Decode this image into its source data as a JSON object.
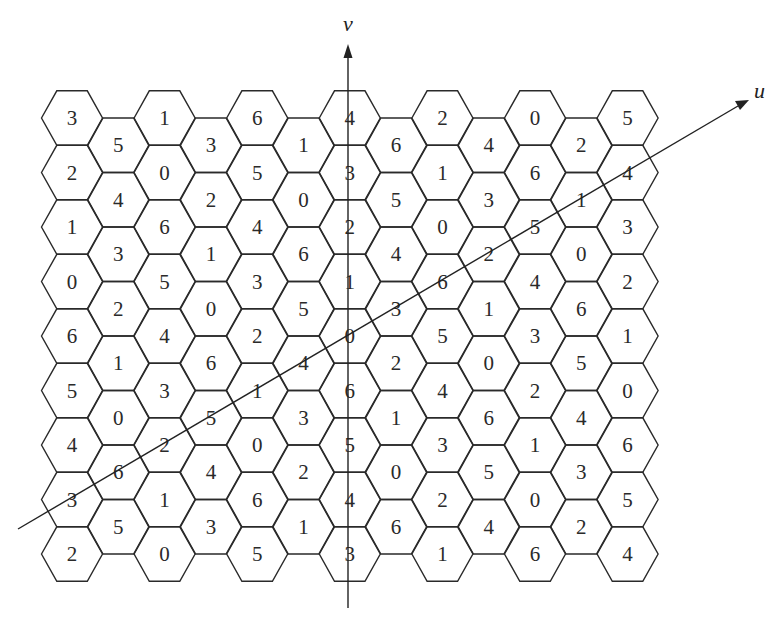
{
  "figure": {
    "type": "hexagonal-grid-diagram",
    "axes": {
      "u_label": "u",
      "v_label": "v"
    },
    "grid": {
      "columns": 11,
      "rows": 10,
      "layout": "flat-top hexagons; odd columns offset down by half a cell",
      "values_by_column": [
        [
          3,
          2,
          1,
          0,
          6,
          5,
          4,
          3,
          2
        ],
        [
          5,
          4,
          3,
          2,
          1,
          0,
          6,
          5
        ],
        [
          1,
          0,
          6,
          5,
          4,
          3,
          2,
          1,
          0
        ],
        [
          3,
          2,
          1,
          0,
          6,
          5,
          4,
          3
        ],
        [
          6,
          5,
          4,
          3,
          2,
          1,
          0,
          6,
          5
        ],
        [
          1,
          0,
          6,
          5,
          4,
          3,
          2,
          1
        ],
        [
          4,
          3,
          2,
          1,
          0,
          6,
          5,
          4,
          3
        ],
        [
          6,
          5,
          4,
          3,
          2,
          1,
          0,
          6
        ],
        [
          2,
          1,
          0,
          6,
          5,
          4,
          3,
          2,
          1
        ],
        [
          4,
          3,
          2,
          1,
          0,
          6,
          5,
          4
        ],
        [
          0,
          6,
          5,
          4,
          3,
          2,
          1,
          0,
          6
        ],
        [
          2,
          1,
          0,
          6,
          5,
          4,
          3,
          2
        ],
        [
          5,
          4,
          3,
          2,
          1,
          0,
          6,
          5,
          4
        ]
      ]
    }
  }
}
